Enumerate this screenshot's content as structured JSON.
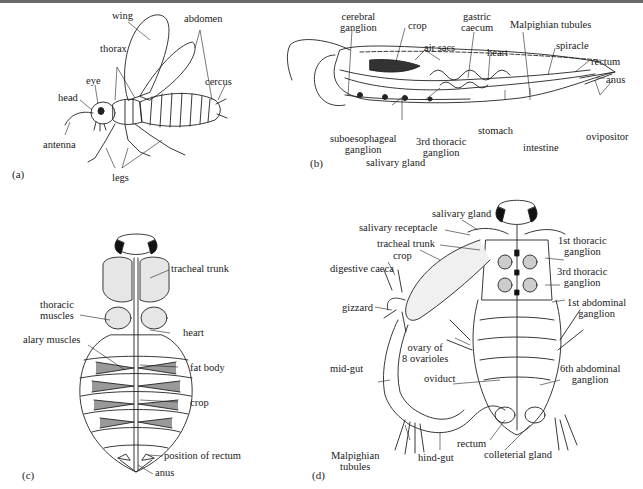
{
  "figure": {
    "panels": [
      {
        "id": "a",
        "tag": "(a)",
        "subject": "external view of insect (side)",
        "labels": {
          "wing": "wing",
          "abdomen": "abdomen",
          "thorax": "thorax",
          "eye": "eye",
          "head": "head",
          "cercus": "cercus",
          "antenna": "antenna",
          "legs": "legs"
        }
      },
      {
        "id": "b",
        "tag": "(b)",
        "subject": "internal anatomy (side section)",
        "labels": {
          "cerebral_ganglion": [
            "cerebral",
            "ganglion"
          ],
          "crop": "crop",
          "gastric_caecum": [
            "gastric",
            "caecum"
          ],
          "malpighian_tubules": "Malpighian tubules",
          "air_sacs": "air sacs",
          "heart": "heart",
          "spiracle": "spiracle",
          "rectum": "rectum",
          "anus": "anus",
          "suboesophageal_ganglion": [
            "suboesophageal",
            "ganglion"
          ],
          "third_thoracic_ganglion": [
            "3rd thoracic",
            "ganglion"
          ],
          "stomach": "stomach",
          "intestine": "intestine",
          "ovipositor": "ovipositor",
          "salivary_gland": "salivary gland"
        }
      },
      {
        "id": "c",
        "tag": "(c)",
        "subject": "dorsal dissection",
        "labels": {
          "tracheal_trunk": "tracheal trunk",
          "thoracic_muscles": [
            "thoracic",
            "muscles"
          ],
          "heart": "heart",
          "alary_muscles": "alary muscles",
          "fat_body": "fat body",
          "crop": "crop",
          "position_of_rectum": "position of rectum",
          "anus": "anus"
        }
      },
      {
        "id": "d",
        "tag": "(d)",
        "subject": "ventral dissection with gut displaced",
        "labels": {
          "salivary_gland": "salivary gland",
          "salivary_receptacle": "salivary receptacle",
          "tracheal_trunk": "tracheal trunk",
          "crop": "crop",
          "digestive_caeca": "digestive caeca",
          "gizzard": "gizzard",
          "first_thoracic_ganglion": [
            "1st thoracic",
            "ganglion"
          ],
          "third_thoracic_ganglion": [
            "3rd thoracic",
            "ganglion"
          ],
          "first_abdominal_ganglion": [
            "1st abdominal",
            "ganglion"
          ],
          "ovary": [
            "ovary of",
            "8 ovarioles"
          ],
          "mid_gut": "mid-gut",
          "oviduct": "oviduct",
          "sixth_abdominal_ganglion": [
            "6th abdominal",
            "ganglion"
          ],
          "malpighian_tubules": [
            "Malpighian",
            "tubules"
          ],
          "hind_gut": "hind-gut",
          "rectum": "rectum",
          "colleterial_gland": "colleterial gland"
        }
      }
    ]
  }
}
